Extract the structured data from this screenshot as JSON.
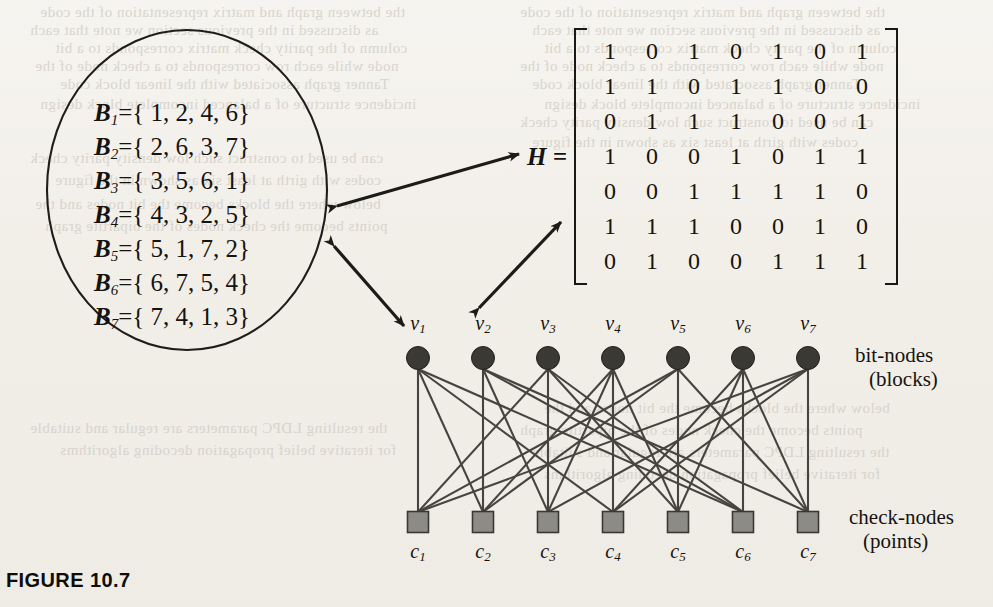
{
  "figure": {
    "caption": "FIGURE 10.7"
  },
  "blocks": {
    "symbol": "B",
    "rows": [
      {
        "index": "1",
        "eq": "={ 1, 2, 4, 6}",
        "elements": [
          1,
          2,
          4,
          6
        ]
      },
      {
        "index": "2",
        "eq": "={ 2, 6, 3, 7}",
        "elements": [
          2,
          6,
          3,
          7
        ]
      },
      {
        "index": "3",
        "eq": "={ 3, 5, 6, 1}",
        "elements": [
          3,
          5,
          6,
          1
        ]
      },
      {
        "index": "4",
        "eq": "={ 4, 3, 2, 5}",
        "elements": [
          4,
          3,
          2,
          5
        ]
      },
      {
        "index": "5",
        "eq": "={ 5, 1, 7, 2}",
        "elements": [
          5,
          1,
          7,
          2
        ]
      },
      {
        "index": "6",
        "eq": "={ 6, 7, 5, 4}",
        "elements": [
          6,
          7,
          5,
          4
        ]
      },
      {
        "index": "7",
        "eq": "={ 7, 4, 1, 3}",
        "elements": [
          7,
          4,
          1,
          3
        ]
      }
    ]
  },
  "matrix": {
    "label": "H =",
    "rows": [
      [
        1,
        0,
        1,
        0,
        1,
        0,
        1
      ],
      [
        1,
        1,
        0,
        1,
        1,
        0,
        0
      ],
      [
        0,
        1,
        1,
        1,
        0,
        0,
        1
      ],
      [
        1,
        0,
        0,
        1,
        0,
        1,
        1
      ],
      [
        0,
        0,
        1,
        1,
        1,
        1,
        0
      ],
      [
        1,
        1,
        1,
        0,
        0,
        1,
        0
      ],
      [
        0,
        1,
        0,
        0,
        1,
        1,
        1
      ]
    ]
  },
  "graph": {
    "bit_nodes": [
      {
        "symbol": "v",
        "index": "1"
      },
      {
        "symbol": "v",
        "index": "2"
      },
      {
        "symbol": "v",
        "index": "3"
      },
      {
        "symbol": "v",
        "index": "4"
      },
      {
        "symbol": "v",
        "index": "5"
      },
      {
        "symbol": "v",
        "index": "6"
      },
      {
        "symbol": "v",
        "index": "7"
      }
    ],
    "check_nodes": [
      {
        "symbol": "c",
        "index": "1"
      },
      {
        "symbol": "c",
        "index": "2"
      },
      {
        "symbol": "c",
        "index": "3"
      },
      {
        "symbol": "c",
        "index": "4"
      },
      {
        "symbol": "c",
        "index": "5"
      },
      {
        "symbol": "c",
        "index": "6"
      },
      {
        "symbol": "c",
        "index": "7"
      }
    ],
    "bit_nodes_legend": {
      "line1": "bit-nodes",
      "line2": "(blocks)"
    },
    "check_nodes_legend": {
      "line1": "check-nodes",
      "line2": "(points)"
    }
  },
  "colors": {
    "page_background": "#f2efe9",
    "ink": "#16130f",
    "bit_node_fill": "#3b3934",
    "check_node_fill": "#8d8b86",
    "edge": "#46443f",
    "bleed_text": "#cfcbc3"
  },
  "bleed_text_lines": [
    "the  between  graph  and  matrix  representation  of  the  code",
    "as  discussed  in  the  previous  section  we  note  that  each",
    "column  of  the  parity  check  matrix  corresponds  to  a  bit",
    "node  while  each  row  corresponds  to  a  check  node  of  the",
    "Tanner  graph  associated  with  the  linear  block  code",
    "incidence  structure  of  a  balanced  incomplete  block  design",
    "can  be  used  to  construct  such  low  density  parity  check",
    "codes  with  girth  at  least  six  as  shown  in  the  figure",
    "below  where  the  blocks  become  the  bit  nodes  and  the",
    "points  become  the  check  nodes  of  the  bipartite  graph",
    "the  resulting  LDPC  parameters  are  regular  and  suitable",
    "for  iterative  belief  propagation  decoding  algorithms"
  ]
}
